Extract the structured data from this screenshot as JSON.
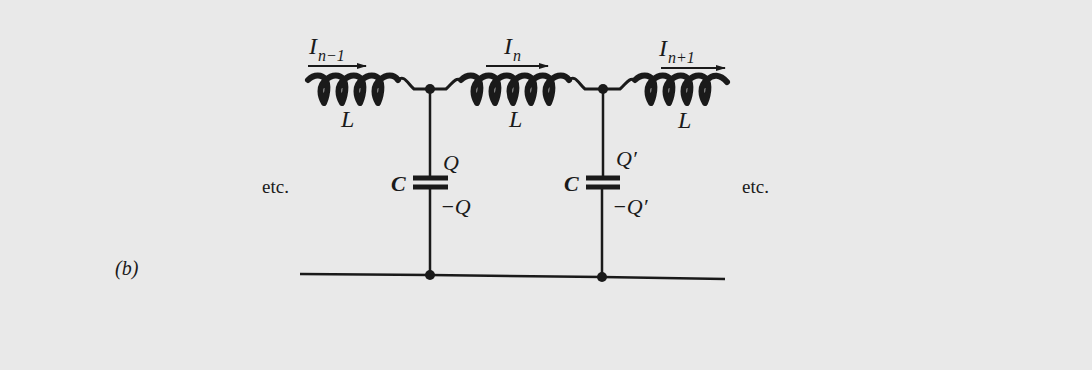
{
  "figure": {
    "panel_label": "(b)",
    "colors": {
      "background": "#e9e9e9",
      "ink": "#1a1a1a"
    }
  },
  "currents": [
    {
      "symbol": "I",
      "subscript": "n−1"
    },
    {
      "symbol": "I",
      "subscript": "n"
    },
    {
      "symbol": "I",
      "subscript": "n+1"
    }
  ],
  "inductors": [
    {
      "label": "L"
    },
    {
      "label": "L"
    },
    {
      "label": "L"
    }
  ],
  "capacitors": [
    {
      "label": "C",
      "charge_top": "Q",
      "charge_bottom": "−Q"
    },
    {
      "label": "C",
      "charge_top": "Q′",
      "charge_bottom": "−Q′"
    }
  ],
  "continuation": {
    "left": "etc.",
    "right": "etc."
  }
}
